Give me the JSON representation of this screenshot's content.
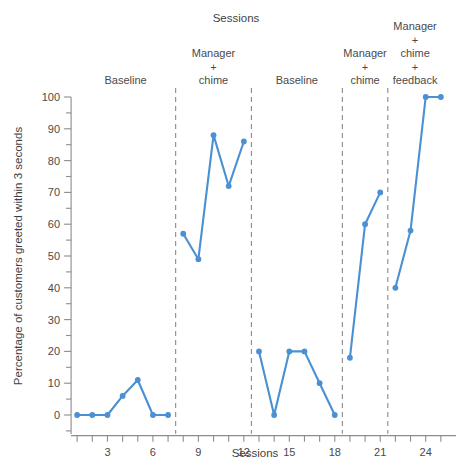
{
  "chart_data": {
    "type": "line",
    "title": "Sessions",
    "xlabel": "Sessions",
    "ylabel": "Percentage of customers greeted within 3 seconds",
    "xlim": [
      0,
      26
    ],
    "ylim": [
      0,
      100
    ],
    "grid": false,
    "legend_position": "none",
    "y_ticks": [
      0,
      10,
      20,
      30,
      40,
      50,
      60,
      70,
      80,
      90,
      100
    ],
    "y_tick_labels": [
      "0",
      "10",
      "20",
      "30",
      "40",
      "50",
      "60",
      "70",
      "80",
      "90",
      "100"
    ],
    "y_minor_ticks": [
      5,
      15,
      25,
      35,
      45,
      55,
      65,
      75,
      85,
      95
    ],
    "x_ticks": [
      1,
      2,
      3,
      4,
      5,
      6,
      7,
      8,
      9,
      10,
      11,
      12,
      13,
      14,
      15,
      16,
      17,
      18,
      19,
      20,
      21,
      22,
      23,
      24,
      25
    ],
    "x_tick_labels": [
      {
        "x": 3,
        "label": "3"
      },
      {
        "x": 6,
        "label": "6"
      },
      {
        "x": 9,
        "label": "9"
      },
      {
        "x": 12,
        "label": "12"
      },
      {
        "x": 15,
        "label": "15"
      },
      {
        "x": 18,
        "label": "18"
      },
      {
        "x": 21,
        "label": "21"
      },
      {
        "x": 24,
        "label": "24"
      }
    ],
    "series": [
      {
        "name": "Percentage of customers greeted within 3 seconds",
        "color": "#4a90d2",
        "marker": "circle",
        "segments": [
          {
            "phase": "Baseline",
            "x": [
              1,
              2,
              3,
              4,
              5,
              6,
              7
            ],
            "values": [
              0,
              0,
              0,
              6,
              11,
              0,
              0
            ]
          },
          {
            "phase": "Manager + chime",
            "x": [
              8,
              9,
              10,
              11,
              12
            ],
            "values": [
              57,
              49,
              88,
              72,
              86
            ]
          },
          {
            "phase": "Baseline",
            "x": [
              13,
              14,
              15,
              16,
              17,
              18
            ],
            "values": [
              20,
              0,
              20,
              20,
              10,
              0
            ]
          },
          {
            "phase": "Manager + chime",
            "x": [
              19,
              20,
              21
            ],
            "values": [
              18,
              60,
              70
            ]
          },
          {
            "phase": "Manager + chime + feedback",
            "x": [
              22,
              23,
              24,
              25
            ],
            "values": [
              40,
              58,
              100,
              100
            ]
          }
        ]
      }
    ],
    "phase_dividers_x": [
      7.5,
      12.5,
      18.5,
      21.5
    ],
    "phases": [
      {
        "id": "baseline-1",
        "label_lines": [
          "Baseline"
        ],
        "center_x": 4.2
      },
      {
        "id": "manager-chime-1",
        "label_lines": [
          "Manager",
          "+",
          "chime"
        ],
        "center_x": 10.0
      },
      {
        "id": "baseline-2",
        "label_lines": [
          "Baseline"
        ],
        "center_x": 15.5
      },
      {
        "id": "manager-chime-2",
        "label_lines": [
          "Manager",
          "+",
          "chime"
        ],
        "center_x": 20.0
      },
      {
        "id": "manager-chime-feedback",
        "label_lines": [
          "Manager",
          "+",
          "chime",
          "+",
          "feedback"
        ],
        "center_x": 23.3
      }
    ],
    "accent_color": "#4a90d2",
    "axis_color": "#8c8c8c",
    "text_color": "#4a4a4a",
    "background": "#ffffff"
  }
}
